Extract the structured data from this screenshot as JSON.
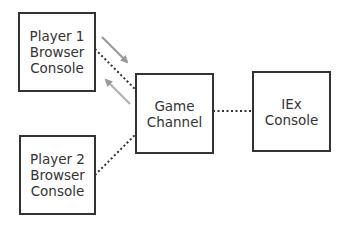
{
  "nodes": {
    "player1": {
      "lines": [
        "Player 1",
        "Browser",
        "Console"
      ]
    },
    "player2": {
      "lines": [
        "Player 2",
        "Browser",
        "Console"
      ]
    },
    "game_channel": {
      "lines": [
        "Game",
        "Channel"
      ]
    },
    "iex": {
      "lines": [
        "IEx",
        "Console"
      ]
    }
  },
  "edges": [
    {
      "from": "player1",
      "to": "game_channel",
      "style": "dotted"
    },
    {
      "from": "player2",
      "to": "game_channel",
      "style": "dotted"
    },
    {
      "from": "game_channel",
      "to": "iex",
      "style": "dotted"
    }
  ],
  "arrows": [
    {
      "direction": "player1-to-game_channel",
      "color": "#999999"
    },
    {
      "direction": "game_channel-to-player1",
      "color": "#aaaaaa"
    }
  ],
  "colors": {
    "stroke": "#333333",
    "arrow": "#999999",
    "background": "#ffffff"
  }
}
